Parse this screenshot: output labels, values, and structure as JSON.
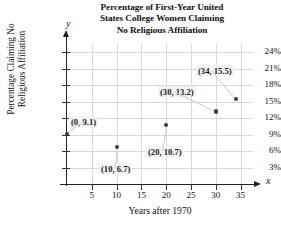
{
  "chart_data": {
    "type": "scatter",
    "title": "Percentage of First-Year United States College Women Claiming No Religious Affiliation",
    "title_lines": [
      "Percentage of First-Year United",
      "States College Women Claiming",
      "No Religious Affiliation"
    ],
    "xlabel": "Years after 1970",
    "ylabel": "Percentage Claiming No Religious Affiliation",
    "ylabel_lines": [
      "Percentage Claiming No",
      "Religious Affiliation"
    ],
    "x_axis_letter": "x",
    "y_axis_letter": "y",
    "xlim": [
      0,
      37.5
    ],
    "ylim": [
      0,
      25.5
    ],
    "xticks": [
      5,
      10,
      15,
      20,
      25,
      30,
      35
    ],
    "xtick_labels": [
      "5",
      "10",
      "15",
      "20",
      "25",
      "30",
      "35"
    ],
    "yticks": [
      3,
      6,
      9,
      12,
      15,
      18,
      21,
      24
    ],
    "ytick_labels": [
      "3%",
      "6%",
      "9%",
      "12%",
      "15%",
      "18%",
      "21%",
      "24%"
    ],
    "grid": true,
    "legend": null,
    "x": [
      0,
      10,
      20,
      30,
      34
    ],
    "values": [
      9.1,
      6.7,
      10.7,
      13.2,
      15.5
    ],
    "points": [
      {
        "x": 0,
        "y": 9.1,
        "label": "(0, 9.1)"
      },
      {
        "x": 10,
        "y": 6.7,
        "label": "(10, 6.7)"
      },
      {
        "x": 20,
        "y": 10.7,
        "label": "(20, 10.7)"
      },
      {
        "x": 30,
        "y": 13.2,
        "label": "(30, 13.2)"
      },
      {
        "x": 34,
        "y": 15.5,
        "label": "(34, 15.5)"
      }
    ],
    "annotations": [
      "(0, 9.1)",
      "(10, 6.7)",
      "(20, 10.7)",
      "(30, 13.2)",
      "(34, 15.5)"
    ],
    "colors": {
      "marker": "#3c3c3c",
      "grid": "#d8d8d8",
      "axis": "#222222",
      "annotation_background": "#f3f3f3",
      "text": "#111111",
      "background": "#ffffff"
    }
  },
  "caption_sliver": ""
}
